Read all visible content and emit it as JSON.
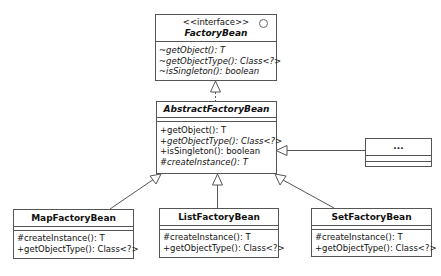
{
  "diagram": {
    "type": "uml-class-diagram",
    "classes": {
      "factory_bean": {
        "stereotype": "<<interface>>",
        "name": "FactoryBean",
        "icon": "interface-circle-icon",
        "operations": [
          "~getObject(): T",
          "~getObjectType(): Class<?>",
          "~isSingleton(): boolean"
        ]
      },
      "abstract_factory_bean": {
        "name": "AbstractFactoryBean",
        "operations": [
          "+getObject(): T",
          "+getObjectType(): Class<?>",
          "+isSingleton(): boolean",
          "#createInstance(): T"
        ]
      },
      "other": {
        "name": "..."
      },
      "map_factory_bean": {
        "name": "MapFactoryBean",
        "operations": [
          "#createInstance(): T",
          "+getObjectType(): Class<?>"
        ]
      },
      "list_factory_bean": {
        "name": "ListFactoryBean",
        "operations": [
          "#createInstance(): T",
          "+getObjectType(): Class<?>"
        ]
      },
      "set_factory_bean": {
        "name": "SetFactoryBean",
        "operations": [
          "#createInstance(): T",
          "+getObjectType(): Class<?>"
        ]
      }
    },
    "relations": [
      {
        "from": "AbstractFactoryBean",
        "to": "FactoryBean",
        "kind": "realization"
      },
      {
        "from": "MapFactoryBean",
        "to": "AbstractFactoryBean",
        "kind": "generalization"
      },
      {
        "from": "ListFactoryBean",
        "to": "AbstractFactoryBean",
        "kind": "generalization"
      },
      {
        "from": "SetFactoryBean",
        "to": "AbstractFactoryBean",
        "kind": "generalization"
      },
      {
        "from": "...",
        "to": "AbstractFactoryBean",
        "kind": "generalization"
      }
    ],
    "colors": {
      "line": "#555555",
      "background": "#ffffff",
      "text": "#111111"
    }
  }
}
